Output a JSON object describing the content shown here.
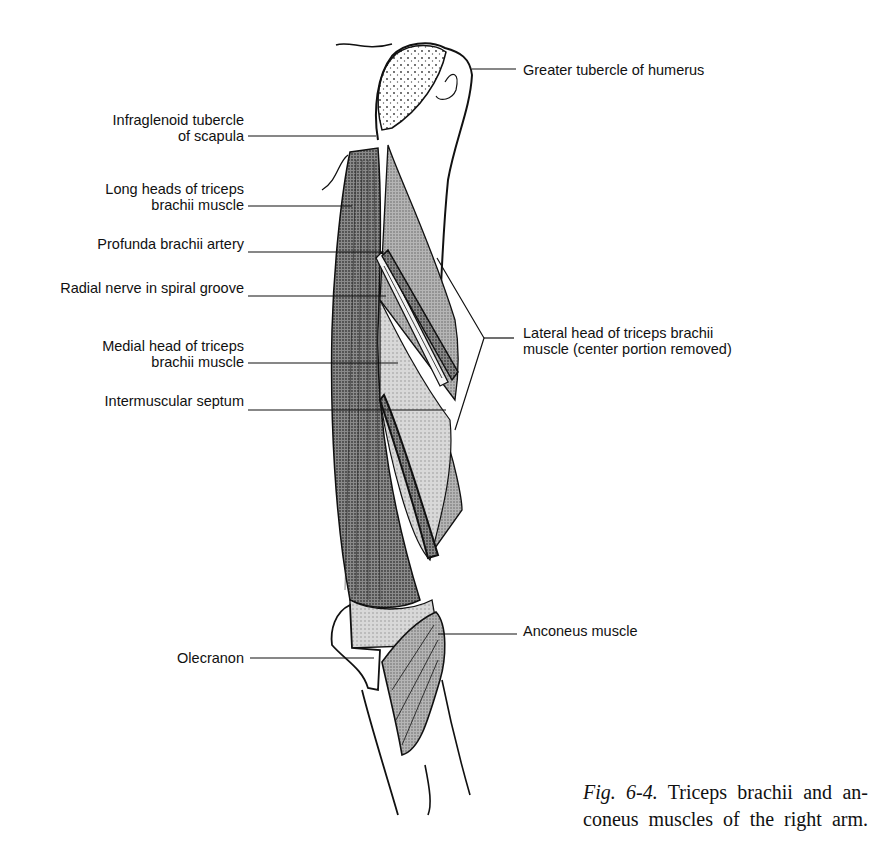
{
  "figure": {
    "caption_number": "Fig. 6-4.",
    "caption_line1": "Triceps brachii and an-",
    "caption_line2": "coneus muscles of the right arm."
  },
  "labels_left": [
    {
      "id": "infraglenoid",
      "lines": [
        "Infraglenoid tubercle",
        "of scapula"
      ]
    },
    {
      "id": "long-heads",
      "lines": [
        "Long heads of triceps",
        "brachii muscle"
      ]
    },
    {
      "id": "profunda",
      "lines": [
        "Profunda brachii artery"
      ]
    },
    {
      "id": "radial-nerve",
      "lines": [
        "Radial nerve in spiral groove"
      ]
    },
    {
      "id": "medial-head",
      "lines": [
        "Medial head of triceps",
        "brachii muscle"
      ]
    },
    {
      "id": "septum",
      "lines": [
        "Intermuscular septum"
      ]
    },
    {
      "id": "olecranon",
      "lines": [
        "Olecranon"
      ]
    }
  ],
  "labels_right": [
    {
      "id": "greater-tubercle",
      "lines": [
        "Greater tubercle of humerus"
      ]
    },
    {
      "id": "lateral-head",
      "lines": [
        "Lateral head of triceps brachii",
        "muscle (center portion removed)"
      ]
    },
    {
      "id": "anconeus",
      "lines": [
        "Anconeus muscle"
      ]
    }
  ],
  "colors": {
    "ink": "#111111",
    "muscle_dark": "#7a7a7a",
    "muscle_mid": "#9a9a9a",
    "muscle_light": "#c4c4c4",
    "bone": "#ffffff"
  }
}
